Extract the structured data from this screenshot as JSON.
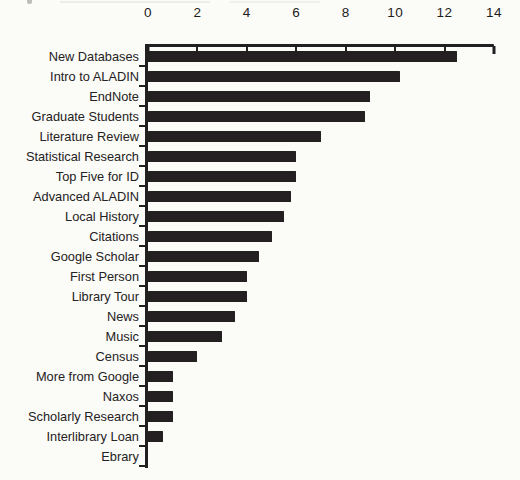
{
  "page": {
    "kind": "scanned-book-figure",
    "background_color": "#fbfbf8",
    "note": "faint remnant of cropped caption text along the very top edge of the scan"
  },
  "chart_data": {
    "type": "bar",
    "orientation": "horizontal",
    "title": "",
    "xlabel": "",
    "ylabel": "",
    "xlim": [
      0,
      14
    ],
    "x_ticks": [
      0,
      2,
      4,
      6,
      8,
      10,
      12,
      14
    ],
    "grid": false,
    "legend": false,
    "axis_position": "top",
    "bar_color": "#242021",
    "axis_color": "#221f20",
    "categories": [
      "New Databases",
      "Intro to ALADIN",
      "EndNote",
      "Graduate Students",
      "Literature Review",
      "Statistical Research",
      "Top Five for ID",
      "Advanced ALADIN",
      "Local History",
      "Citations",
      "Google Scholar",
      "First Person",
      "Library Tour",
      "News",
      "Music",
      "Census",
      "More from Google",
      "Naxos",
      "Scholarly Research",
      "Interlibrary Loan",
      "Ebrary"
    ],
    "values": [
      12.5,
      10.2,
      9,
      8.8,
      7,
      6,
      6,
      5.8,
      5.5,
      5,
      4.5,
      4,
      4,
      3.5,
      3,
      2,
      1,
      1,
      1,
      0.6,
      0
    ]
  }
}
